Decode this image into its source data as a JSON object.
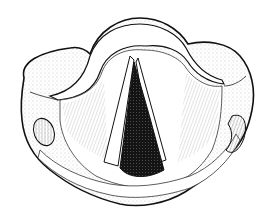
{
  "figure": {
    "style": "engraving",
    "colors": {
      "background": "#ffffff",
      "ink": "#111111",
      "glottis": "#141414",
      "hatch": "#555555"
    }
  }
}
